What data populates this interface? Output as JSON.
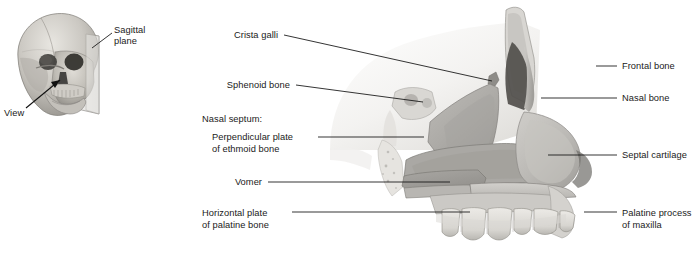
{
  "figure": {
    "background_color": "#ffffff",
    "width": 696,
    "height": 260
  },
  "inset": {
    "name": "skull-orientation-inset",
    "description": "Three-quarter view of a human skull with a translucent sagittal plane rectangle",
    "labels": {
      "sagittal_plane_line1": "Sagittal",
      "sagittal_plane_line2": "plane",
      "view": "View"
    },
    "colors": {
      "bone_light": "#dcdad5",
      "bone_mid": "#b4b1aa",
      "bone_dark": "#8a8781",
      "bone_shadow": "#5f5d58",
      "cavity": "#3a3936",
      "plane_fill": "#e8e7e4",
      "plane_stroke": "#9a9894"
    }
  },
  "main_illustration": {
    "name": "nasal-septum-sagittal-view",
    "colors": {
      "bone_pale": "#ecebe8",
      "bone_light": "#d6d4d0",
      "ethmoid_plate": "#b0aeaa",
      "vomer": "#9d9b97",
      "septal_cartilage": "#bcbab6",
      "palate": "#c6c4c0",
      "tooth": "#e4e2dd",
      "cavity_dark": "#4a4947",
      "outline": "#6e6c68"
    }
  },
  "labels_left": [
    {
      "id": "crista-galli",
      "lines": [
        "Crista galli"
      ],
      "text_x": 278,
      "text_y": 38,
      "leader": [
        [
          284,
          35
        ],
        [
          492,
          81
        ]
      ],
      "indent": false
    },
    {
      "id": "sphenoid-bone",
      "lines": [
        "Sphenoid bone"
      ],
      "text_x": 290,
      "text_y": 88,
      "leader": [
        [
          296,
          85
        ],
        [
          423,
          102
        ]
      ],
      "indent": false
    },
    {
      "id": "nasal-septum-group",
      "lines": [
        "Nasal septum:"
      ],
      "text_x": 202,
      "text_y": 122,
      "leader": null,
      "indent": false,
      "heading": true
    },
    {
      "id": "perpendicular-plate-of-ethmoid-bone",
      "lines": [
        "Perpendicular plate",
        "of ethmoid bone"
      ],
      "text_x": 212,
      "text_y": 140,
      "leader": [
        [
          318,
          137
        ],
        [
          420,
          137
        ]
      ],
      "indent": true
    },
    {
      "id": "vomer",
      "lines": [
        "Vomer"
      ],
      "text_x": 236,
      "text_y": 185,
      "leader": [
        [
          268,
          182
        ],
        [
          450,
          182
        ]
      ],
      "indent": false
    },
    {
      "id": "horizontal-plate-of-palatine-bone",
      "lines": [
        "Horizontal plate",
        "of palatine bone"
      ],
      "text_x": 202,
      "text_y": 216,
      "leader": [
        [
          292,
          212
        ],
        [
          470,
          212
        ]
      ],
      "indent": false
    }
  ],
  "labels_right": [
    {
      "id": "frontal-bone",
      "lines": [
        "Frontal bone"
      ],
      "text_x": 622,
      "text_y": 69,
      "leader": [
        [
          596,
          66
        ],
        [
          617,
          66
        ]
      ]
    },
    {
      "id": "nasal-bone",
      "lines": [
        "Nasal bone"
      ],
      "text_x": 622,
      "text_y": 101,
      "leader": [
        [
          541,
          98
        ],
        [
          617,
          98
        ]
      ]
    },
    {
      "id": "septal-cartilage",
      "lines": [
        "Septal cartilage"
      ],
      "text_x": 622,
      "text_y": 158,
      "leader": [
        [
          548,
          155
        ],
        [
          617,
          155
        ]
      ]
    },
    {
      "id": "palatine-process-of-maxilla",
      "lines": [
        "Palatine process",
        "of maxilla"
      ],
      "text_x": 622,
      "text_y": 216,
      "leader": [
        [
          584,
          212
        ],
        [
          617,
          212
        ]
      ]
    }
  ]
}
